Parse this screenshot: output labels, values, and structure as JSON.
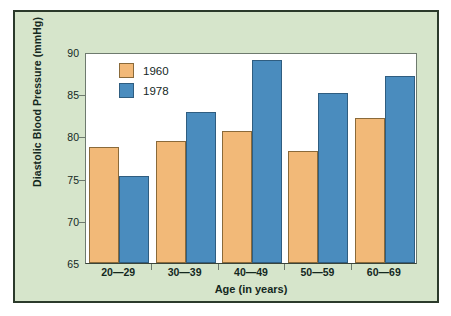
{
  "chart_data": {
    "type": "bar",
    "title": "",
    "xlabel": "Age (in years)",
    "ylabel": "Diastolic Blood Pressure (mmHg)",
    "categories": [
      "20—29",
      "30—39",
      "40—49",
      "50—59",
      "60—69"
    ],
    "series": [
      {
        "name": "1960",
        "color": "#f2b978",
        "values": [
          78.7,
          79.5,
          80.6,
          78.3,
          82.2
        ]
      },
      {
        "name": "1978",
        "color": "#4a8cbe",
        "values": [
          75.3,
          82.9,
          89.1,
          85.2,
          87.2
        ]
      }
    ],
    "ylim": [
      65,
      90
    ],
    "yticks": [
      65,
      70,
      75,
      80,
      85,
      90
    ],
    "ytick_labels": [
      "65",
      "70",
      "75",
      "80",
      "85",
      "90"
    ],
    "grid": false,
    "legend_position": "top-left",
    "legend": [
      "1960",
      "1978"
    ]
  },
  "colors": {
    "background": "#d6e5cb",
    "frame_border": "#2b3a2b",
    "plot_background": "#ffffff",
    "axis": "#6e7a6e",
    "text": "#14281e",
    "series_1960": "#f2b978",
    "series_1978": "#4a8cbe"
  }
}
